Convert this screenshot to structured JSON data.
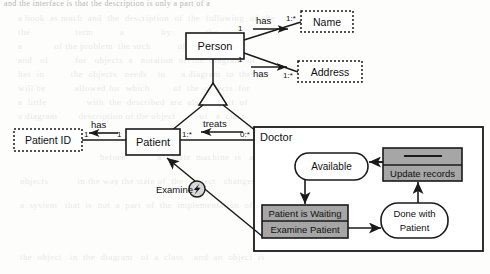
{
  "diagram": {
    "colors": {
      "line": "#1a1a1a",
      "gray_fill": "#a6a6a6",
      "white_fill": "#ffffff",
      "text": "#111111",
      "page_bg": "#fdfdfc"
    }
  },
  "classes": {
    "person": {
      "name": "Person",
      "style": "solid"
    },
    "patient": {
      "name": "Patient",
      "style": "solid"
    },
    "doctor": {
      "name": "Doctor",
      "style": "solid"
    }
  },
  "attributes": {
    "name": {
      "name": "Name",
      "style": "dotted"
    },
    "address": {
      "name": "Address",
      "style": "dotted"
    },
    "patient_id": {
      "name": "Patient ID",
      "style": "dotted"
    }
  },
  "associations": [
    {
      "id": "person-name",
      "label": "has",
      "source_mult": "1",
      "target_mult": "1:*"
    },
    {
      "id": "person-address",
      "label": "has",
      "source_mult": "1",
      "target_mult": "1:*"
    },
    {
      "id": "patientid-patient",
      "label": "has",
      "source_mult": "1",
      "target_mult": "1"
    },
    {
      "id": "patient-doctor",
      "label": "treats",
      "source_mult": "1:*",
      "target_mult": "0:*"
    }
  ],
  "generalization": {
    "parent": "Person",
    "children": [
      "Patient",
      "Doctor"
    ]
  },
  "signal": {
    "label": "Examine",
    "icon": "lightning-bolt-icon",
    "from": "Examine Patient",
    "to": "Patient"
  },
  "state_machine": {
    "owner": "Doctor",
    "states": [
      {
        "id": "available",
        "label": "Available",
        "shape": "rounded",
        "fill": "white"
      },
      {
        "id": "waiting",
        "label": "Patient is Waiting",
        "shape": "rect",
        "fill": "gray",
        "action": "Examine Patient"
      },
      {
        "id": "done",
        "label": "Done with\nPatient",
        "shape": "rounded",
        "fill": "white"
      },
      {
        "id": "update",
        "label": "Update records",
        "shape": "rect",
        "fill": "gray",
        "header": ""
      }
    ],
    "transitions": [
      {
        "from": "available",
        "to": "waiting"
      },
      {
        "from": "waiting",
        "to": "done"
      },
      {
        "from": "done",
        "to": "update"
      },
      {
        "from": "update",
        "to": "available"
      }
    ]
  },
  "state_labels": {
    "available": "Available",
    "waiting": "Patient is Waiting",
    "examine_patient": "Examine Patient",
    "done_line1": "Done with",
    "done_line2": "Patient",
    "update_records": "Update records"
  },
  "background_bleed": {
    "top": "and the interface is that the description is only a part of a",
    "rows": [
      "a book  as much  and  the  description  of  the  following  of  the",
      "the                 term          a              by             the",
      "a            of the problem  the such          of the classes the",
      "and   of          for   objects  a   notation  of  the  diagram  of",
      "has  in          the  objects   needs    to      a diagram  to  the",
      "will be           allowed for  which         of  the  objects  for",
      "a  little               with  the  described  are  also  a  part  of",
      "a diagram        description of the object         of   a  class",
      "before            a    state  machine  is   a   behaviour   of  an",
      "objects           in the way the state of  the   object   changes"
    ],
    "lower": [
      "a  system   that  is  not  a  part  of  the  implementation  of  the",
      "the  object   in  the  diagram   of  a  class    and  an  object  is"
    ]
  }
}
